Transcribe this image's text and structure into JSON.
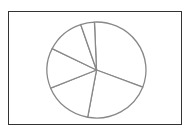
{
  "chart_data": {
    "type": "pie",
    "title": "",
    "labels": [
      "",
      "",
      "",
      "",
      "",
      ""
    ],
    "values": [
      31.5,
      22,
      16,
      13.5,
      12.5,
      4.5
    ],
    "start_angle_deg": -2.4,
    "direction": "clockwise",
    "legend": "none",
    "slice_fill": "#ffffff",
    "slice_stroke": "#888888"
  }
}
